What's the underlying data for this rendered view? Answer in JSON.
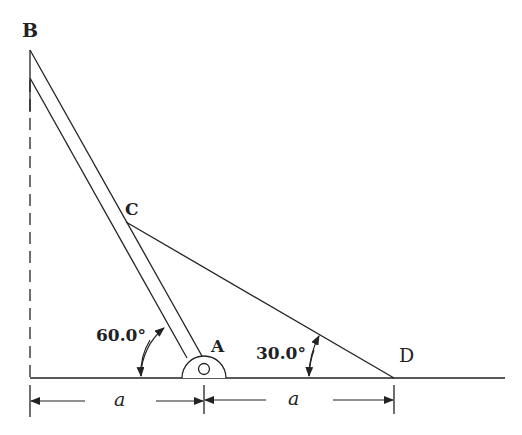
{
  "figure": {
    "points": {
      "A": "A",
      "B": "B",
      "C": "C",
      "D": "D"
    },
    "angles": {
      "at_A": "60.0°",
      "at_D": "30.0°"
    },
    "dimensions": {
      "left": "a",
      "right": "a"
    }
  },
  "colors": {
    "ink": "#222222",
    "background": "#ffffff"
  }
}
